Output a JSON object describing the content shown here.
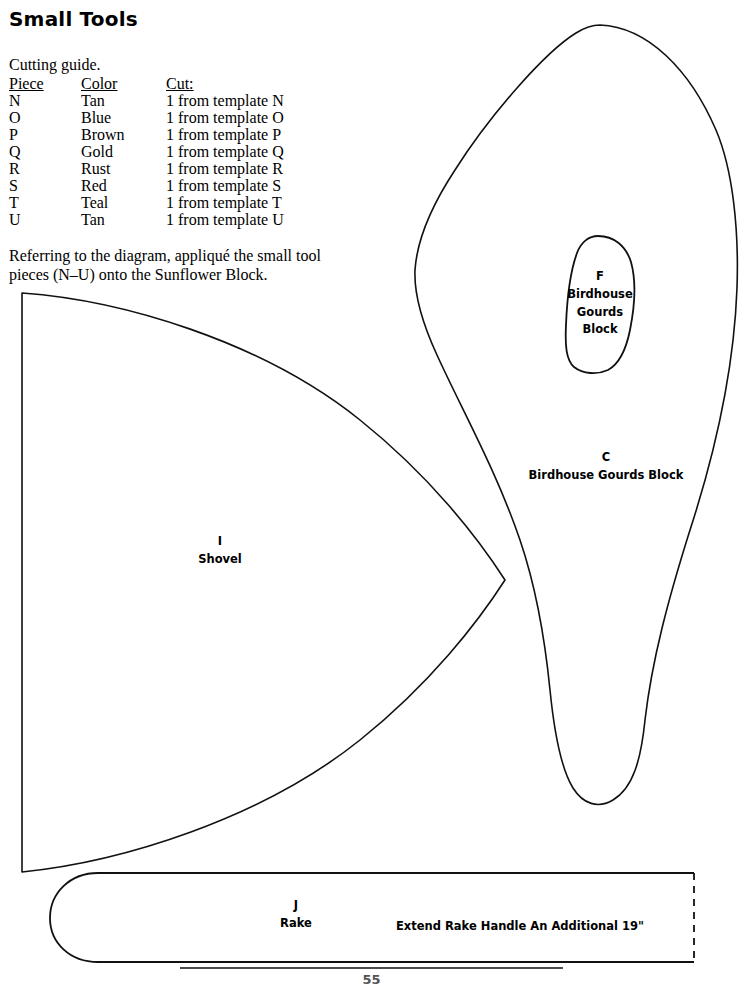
{
  "document": {
    "title": "Small Tools",
    "page_number": "55"
  },
  "cutting_guide": {
    "heading": "Cutting guide.",
    "columns": [
      "Piece",
      "Color",
      "Cut:"
    ],
    "rows": [
      {
        "piece": "N",
        "color": "Tan",
        "cut": "1 from template N"
      },
      {
        "piece": "O",
        "color": "Blue",
        "cut": "1 from template O"
      },
      {
        "piece": "P",
        "color": "Brown",
        "cut": "1 from template P"
      },
      {
        "piece": "Q",
        "color": "Gold",
        "cut": "1 from template Q"
      },
      {
        "piece": "R",
        "color": "Rust",
        "cut": "1 from template R"
      },
      {
        "piece": "S",
        "color": "Red",
        "cut": "1 from template S"
      },
      {
        "piece": "T",
        "color": "Teal",
        "cut": "1 from template T"
      },
      {
        "piece": "U",
        "color": "Tan",
        "cut": "1 from template U"
      }
    ]
  },
  "instructions": {
    "text": "Referring to the diagram, appliqué the small tool pieces (N–U) onto the Sunflower Block."
  },
  "diagram": {
    "shapes": [
      {
        "id": "F",
        "letter": "F",
        "name": "birdhouse-gourds-block-inner",
        "lines": [
          "Birdhouse",
          "Gourds",
          "Block"
        ]
      },
      {
        "id": "C",
        "letter": "C",
        "name": "birdhouse-gourds-block-outer",
        "lines": [
          "Birdhouse Gourds Block"
        ]
      },
      {
        "id": "I",
        "letter": "I",
        "name": "shovel",
        "lines": [
          "Shovel"
        ]
      },
      {
        "id": "J",
        "letter": "J",
        "name": "rake",
        "lines": [
          "Rake"
        ]
      }
    ],
    "notes": {
      "extend_rake": "Extend Rake Handle An Additional 19\""
    }
  },
  "colors": {
    "ink": "#111111",
    "paper": "#ffffff"
  }
}
